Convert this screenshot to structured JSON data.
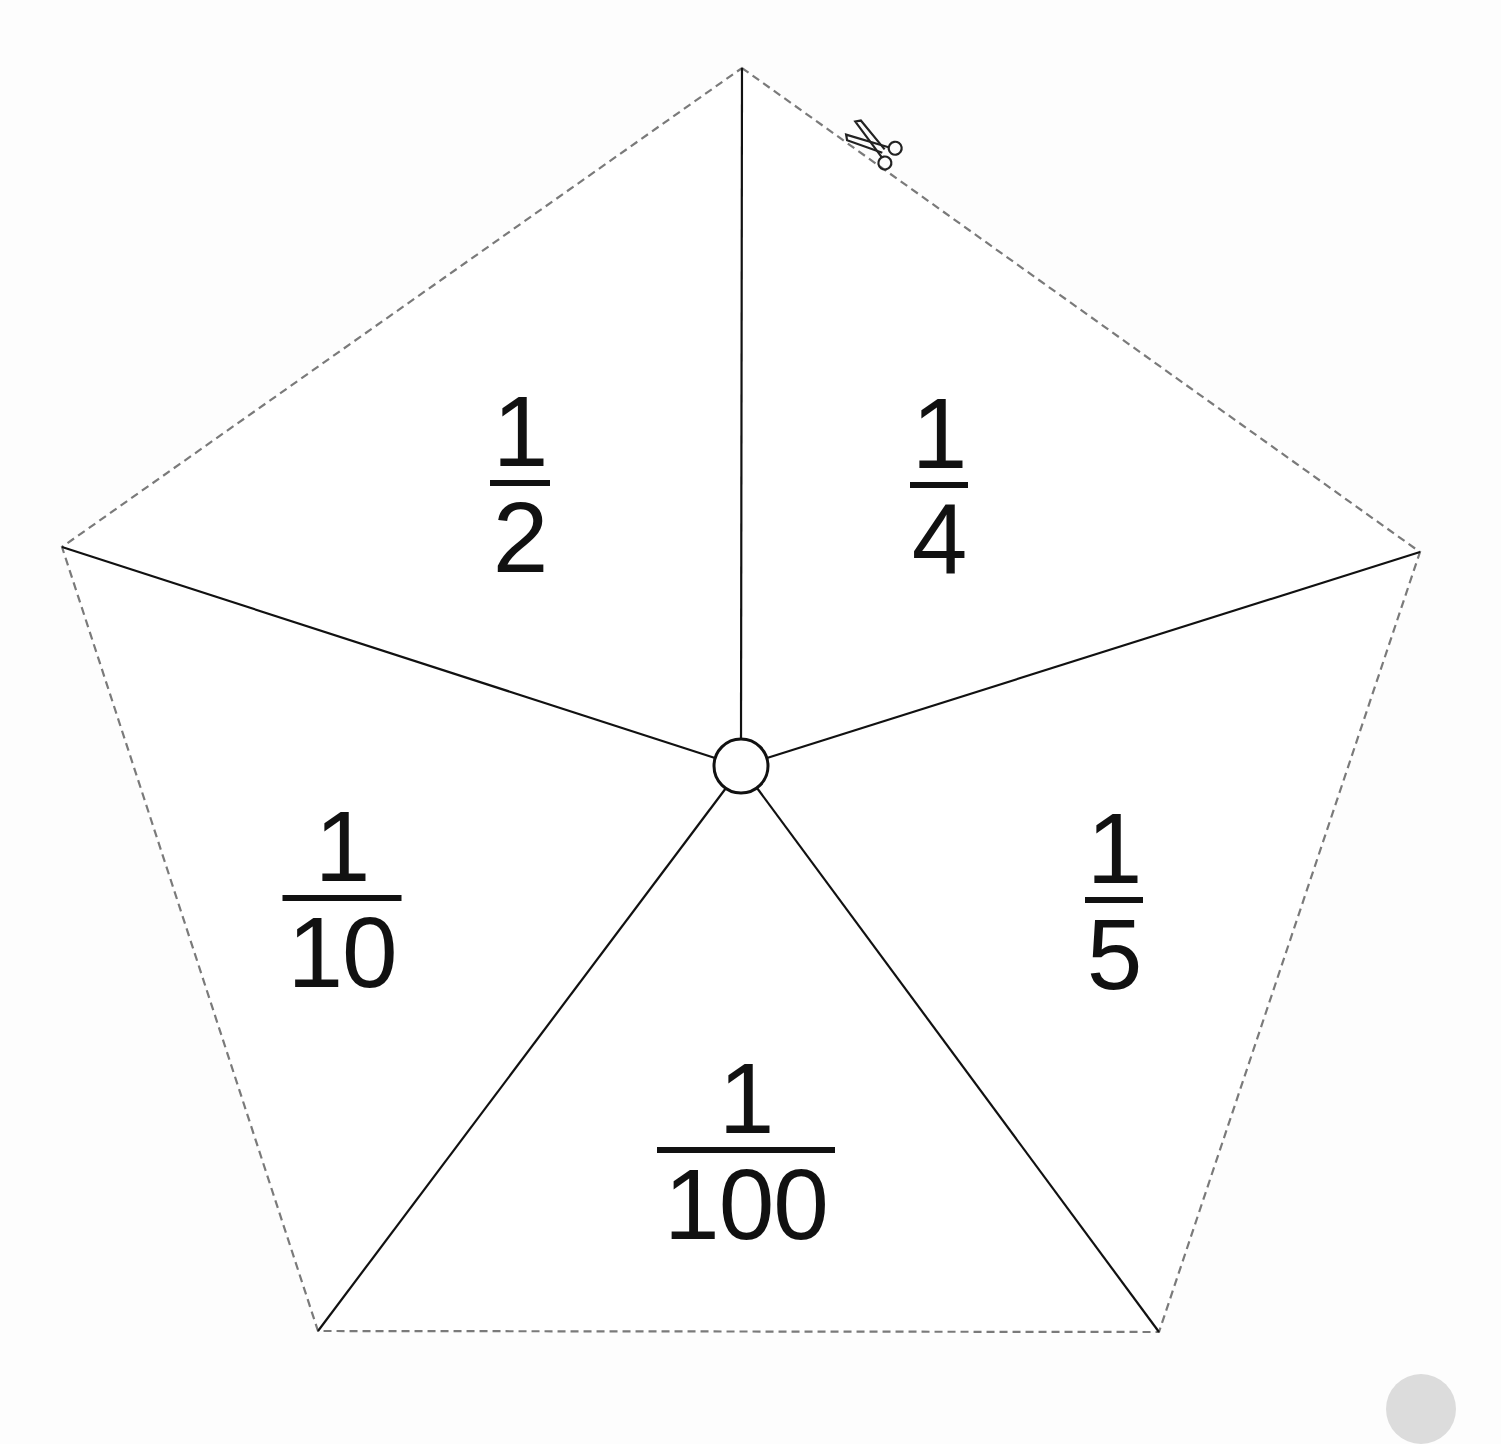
{
  "diagram": {
    "type": "pentagon-spinner",
    "outline_style": "dashed cut line",
    "cut_icon": "scissors-icon",
    "colors": {
      "background": "#fdfdfd",
      "cut_line": "#7a7a7a",
      "divider_line": "#111111",
      "text": "#111111",
      "corner_badge": "#dcdcdc"
    },
    "vertices": {
      "top": [
        742,
        68
      ],
      "right": [
        1420,
        552
      ],
      "bottom_right": [
        1159,
        1332
      ],
      "bottom_left": [
        318,
        1331
      ],
      "left": [
        62,
        547
      ]
    },
    "center": {
      "x": 741,
      "y": 766,
      "r": 27
    },
    "segments": [
      {
        "id": "top-left",
        "numerator": "1",
        "denominator": "2",
        "x": 520,
        "y": 390,
        "bar_width": 60
      },
      {
        "id": "top-right",
        "numerator": "1",
        "denominator": "4",
        "x": 939,
        "y": 392,
        "bar_width": 58
      },
      {
        "id": "right",
        "numerator": "1",
        "denominator": "5",
        "x": 1114,
        "y": 807,
        "bar_width": 58
      },
      {
        "id": "bottom",
        "numerator": "1",
        "denominator": "100",
        "x": 746,
        "y": 1057,
        "bar_width": 178
      },
      {
        "id": "left",
        "numerator": "1",
        "denominator": "10",
        "x": 342,
        "y": 805,
        "bar_width": 119
      }
    ]
  }
}
